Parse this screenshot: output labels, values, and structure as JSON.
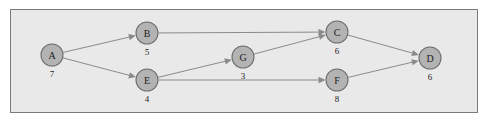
{
  "diagram": {
    "type": "directed-graph",
    "frame": {
      "border_color": "#7a7a7a",
      "background_color": "#e9e9e9"
    },
    "node_style": {
      "fill_color": "#b3b3b3",
      "stroke_color": "#6e6e6e",
      "radius": 11
    },
    "edge_style": {
      "color": "#8a8a8a",
      "arrowhead": "filled-triangle"
    },
    "nodes": [
      {
        "id": "A",
        "label": "A",
        "weight": "7",
        "x": 52,
        "y": 55
      },
      {
        "id": "B",
        "label": "B",
        "weight": "5",
        "x": 147,
        "y": 33
      },
      {
        "id": "E",
        "label": "E",
        "weight": "4",
        "x": 147,
        "y": 80
      },
      {
        "id": "G",
        "label": "G",
        "weight": "3",
        "x": 243,
        "y": 57
      },
      {
        "id": "C",
        "label": "C",
        "weight": "6",
        "x": 337,
        "y": 32
      },
      {
        "id": "F",
        "label": "F",
        "weight": "8",
        "x": 337,
        "y": 80
      },
      {
        "id": "D",
        "label": "D",
        "weight": "6",
        "x": 430,
        "y": 58
      }
    ],
    "edges": [
      {
        "from": "A",
        "to": "B"
      },
      {
        "from": "A",
        "to": "E"
      },
      {
        "from": "B",
        "to": "C"
      },
      {
        "from": "E",
        "to": "G"
      },
      {
        "from": "E",
        "to": "F"
      },
      {
        "from": "G",
        "to": "C"
      },
      {
        "from": "C",
        "to": "D"
      },
      {
        "from": "F",
        "to": "D"
      }
    ]
  }
}
